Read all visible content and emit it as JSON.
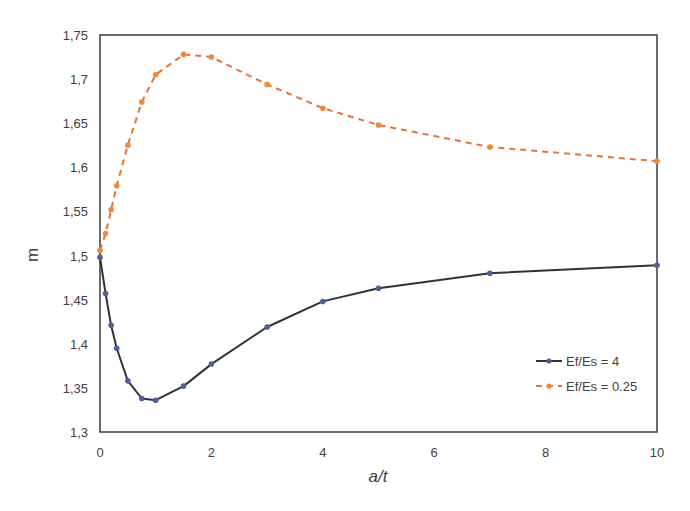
{
  "chart_data": {
    "type": "line",
    "title": "",
    "xlabel": "a/t",
    "ylabel": "m",
    "xlim": [
      0,
      10
    ],
    "ylim": [
      1.3,
      1.75
    ],
    "x_ticks": [
      0,
      2,
      4,
      6,
      8,
      10
    ],
    "x_tick_labels": [
      "0",
      "2",
      "4",
      "6",
      "8",
      "10"
    ],
    "y_ticks": [
      1.3,
      1.35,
      1.4,
      1.45,
      1.5,
      1.55,
      1.6,
      1.65,
      1.7,
      1.75
    ],
    "y_tick_labels": [
      "1,3",
      "1,35",
      "1,4",
      "1,45",
      "1,5",
      "1,55",
      "1,6",
      "1,65",
      "1,7",
      "1,75"
    ],
    "grid": false,
    "legend_position": "lower right, inside plot",
    "series": [
      {
        "name": "Ef/Es = 4",
        "line_style": "solid",
        "line_color": "#2f3336",
        "marker_color": "#4f5f9e",
        "x": [
          0,
          0.1,
          0.2,
          0.3,
          0.5,
          0.75,
          1,
          1.5,
          2,
          3,
          4,
          5,
          7,
          10
        ],
        "y": [
          1.498,
          1.457,
          1.421,
          1.395,
          1.358,
          1.338,
          1.336,
          1.352,
          1.377,
          1.419,
          1.448,
          1.463,
          1.48,
          1.489
        ]
      },
      {
        "name": "Ef/Es = 0.25",
        "line_style": "dashed",
        "line_color": "#e8703a",
        "marker_color": "#ee8a3c",
        "x": [
          0,
          0.1,
          0.2,
          0.3,
          0.5,
          0.75,
          1,
          1.5,
          2,
          3,
          4,
          5,
          7,
          10
        ],
        "y": [
          1.506,
          1.525,
          1.552,
          1.579,
          1.625,
          1.674,
          1.705,
          1.728,
          1.725,
          1.694,
          1.667,
          1.648,
          1.623,
          1.607
        ]
      }
    ]
  }
}
